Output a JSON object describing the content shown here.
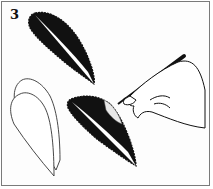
{
  "illustration": {
    "step_number": "3",
    "description": "Instructional line drawing: a hand holding a brush/pen paints the inside of a dark leaf shape; a dark leaf with a white central vein at top; two stacked outlined (white) leaf shapes at bottom-left.",
    "colors": {
      "ink": "#111111",
      "paper": "#fdfdfd",
      "border": "#7a7a7a"
    }
  }
}
